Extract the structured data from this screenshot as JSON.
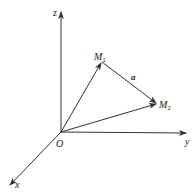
{
  "diagram": {
    "type": "3d-coordinate-vector-diagram",
    "colors": {
      "line": "#333333",
      "text": "#222222",
      "background": "#ffffff"
    },
    "axes": {
      "z": {
        "label": "z"
      },
      "y": {
        "label": "y"
      },
      "x": {
        "label": "x"
      }
    },
    "origin": {
      "label": "O"
    },
    "points": {
      "M1": {
        "label": "M",
        "subscript": "1"
      },
      "M2": {
        "label": "M",
        "subscript": "2"
      }
    },
    "vectors": {
      "a": {
        "label": "a",
        "from": "M1",
        "to": "M2"
      },
      "OM1": {
        "from": "O",
        "to": "M1"
      },
      "OM2": {
        "from": "O",
        "to": "M2"
      }
    }
  }
}
